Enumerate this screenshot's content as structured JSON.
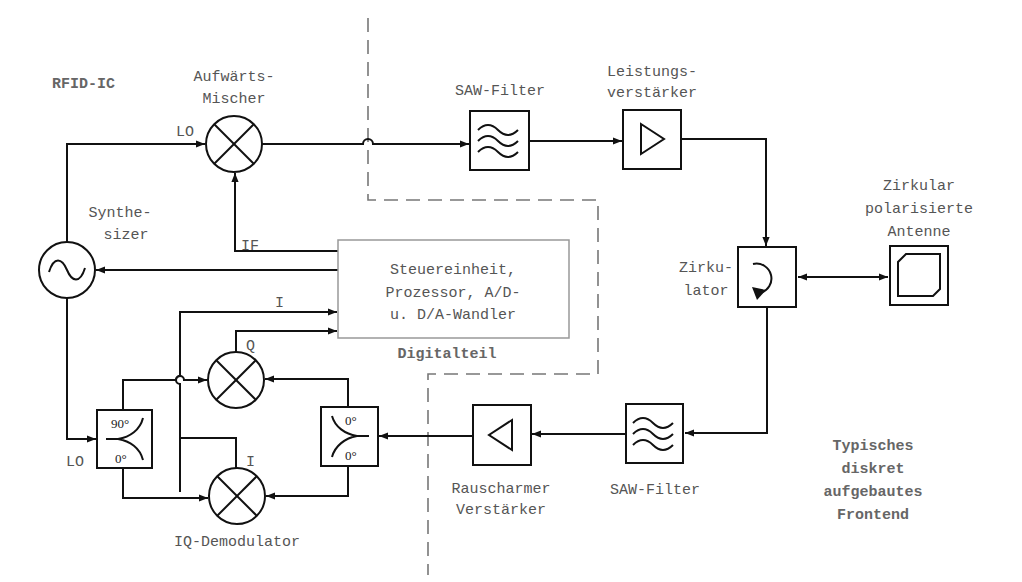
{
  "diagram": {
    "title_label": "RFID-IC",
    "regions": {
      "digital_label": "Digitalteil",
      "frontend_label_lines": [
        "Typisches",
        "diskret",
        "aufgebautes",
        "Frontend"
      ]
    },
    "blocks": {
      "up_mixer": {
        "label_lines": [
          "Aufwärts-",
          "Mischer"
        ],
        "icon": "mixer-icon"
      },
      "saw_filter_tx": {
        "label": "SAW-Filter",
        "icon": "bandpass-filter-icon"
      },
      "power_amp": {
        "label_lines": [
          "Leistungs-",
          "verstärker"
        ],
        "icon": "amplifier-icon"
      },
      "circulator": {
        "label_lines": [
          "Zirku-",
          "lator"
        ],
        "icon": "circulator-icon"
      },
      "antenna": {
        "label_lines": [
          "Zirkular",
          "polarisierte",
          "Antenne"
        ],
        "icon": "patch-antenna-icon"
      },
      "synthesizer": {
        "label_lines": [
          "Synthe-",
          "sizer"
        ],
        "icon": "oscillator-icon"
      },
      "control_unit": {
        "label_lines": [
          "Steuereinheit,",
          "Prozessor, A/D-",
          "u. D/A-Wandler"
        ]
      },
      "saw_filter_rx": {
        "label": "SAW-Filter",
        "icon": "bandpass-filter-icon"
      },
      "lna": {
        "label_lines": [
          "Rauscharmer",
          "Verstärker"
        ],
        "icon": "amplifier-icon"
      },
      "hybrid_lo": {
        "top_port": "90°",
        "bottom_port": "0°",
        "icon": "hybrid-coupler-icon"
      },
      "splitter_rx": {
        "top_port": "0°",
        "bottom_port": "0°",
        "icon": "power-splitter-icon"
      },
      "iq_demodulator": {
        "label": "IQ-Demodulator",
        "icon": "mixer-icon"
      }
    },
    "signals": {
      "lo_up": "LO",
      "if": "IF",
      "i_out": "I",
      "q_out": "Q",
      "i_mixer": "I",
      "lo_down": "LO"
    }
  }
}
